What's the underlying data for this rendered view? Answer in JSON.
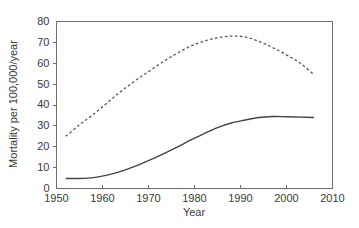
{
  "chart_data": {
    "type": "line",
    "title": "",
    "subtitle": "",
    "xlabel": "Year",
    "ylabel": "Mortality per 100,000/year",
    "xlim": [
      1950,
      2010
    ],
    "ylim": [
      0,
      80
    ],
    "xticks": [
      1950,
      1960,
      1970,
      1980,
      1990,
      2000,
      2010
    ],
    "yticks": [
      0,
      10,
      20,
      30,
      40,
      50,
      60,
      70,
      80
    ],
    "grid": false,
    "legend": "none",
    "x": [
      1952,
      1955,
      1958,
      1961,
      1964,
      1967,
      1970,
      1973,
      1976,
      1979,
      1982,
      1985,
      1988,
      1991,
      1994,
      1997,
      2000,
      2003,
      2006
    ],
    "series": [
      {
        "name": "dashed-series",
        "style": "dashed",
        "color": "#555555",
        "values": [
          25.0,
          30.5,
          35.5,
          41.0,
          46.5,
          51.5,
          56.0,
          60.5,
          64.5,
          68.0,
          70.5,
          72.2,
          73.0,
          72.6,
          70.5,
          67.5,
          64.0,
          60.0,
          54.5
        ]
      },
      {
        "name": "solid-series",
        "style": "solid",
        "color": "#444444",
        "values": [
          4.8,
          4.8,
          5.2,
          6.4,
          8.2,
          10.6,
          13.4,
          16.4,
          19.6,
          23.0,
          26.2,
          29.2,
          31.4,
          32.8,
          34.0,
          34.5,
          34.4,
          34.2,
          34.0
        ]
      }
    ]
  },
  "axis": {
    "y_tick_labels": [
      "0",
      "10",
      "20",
      "30",
      "40",
      "50",
      "60",
      "70",
      "80"
    ],
    "x_tick_labels": [
      "1950",
      "1960",
      "1970",
      "1980",
      "1990",
      "2000",
      "2010"
    ],
    "x_title": "Year",
    "y_title": "Mortality per 100,000/year"
  }
}
